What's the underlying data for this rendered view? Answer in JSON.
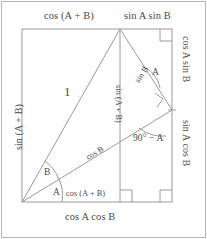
{
  "figure": {
    "stroke_color": "#9a9a9a",
    "frame_color": "#b5b5b5",
    "text_color": "#4a4a4a",
    "background": "#ffffff"
  },
  "labels": {
    "top_left": "cos (A + B)",
    "top_right": "sin A sin B",
    "left_side": "sin (A + B)",
    "right_upper": "cos A sin B",
    "right_lower": "sin A cos B",
    "bottom_outer": "cos A cos B",
    "bottom_inner": "cos (A + B)",
    "hypotenuse": "1",
    "diagonal": "cos B",
    "upper_segment": "sin B",
    "vertical_inner": "sin (A + B)",
    "angle_right": "90° − A",
    "angle_upper_right": "A",
    "angle_vertex_upper": "B",
    "angle_vertex_lower": "A"
  },
  "identities": {
    "sine": "sin (A + B) = sin A cos B + cos A sin B",
    "cosine": "cos (A + B) = cos A cos B − sin A sin B"
  },
  "geometry": {
    "rect_left": 22,
    "rect_top": 29,
    "rect_right": 172,
    "rect_bottom": 202,
    "apex_x": 120,
    "apex_y": 29,
    "right_vertex_x": 172,
    "right_vertex_y": 110
  }
}
